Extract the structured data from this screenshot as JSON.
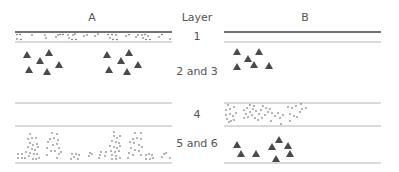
{
  "diagram": {
    "columns": {
      "left": "A",
      "middle": "Layer",
      "right": "B"
    },
    "layers": [
      {
        "id": "1",
        "label": "1"
      },
      {
        "id": "2-3",
        "label": "2 and 3"
      },
      {
        "id": "4",
        "label": "4"
      },
      {
        "id": "5-6",
        "label": "5 and 6"
      }
    ],
    "colors": {
      "dark_line": "#444444",
      "light_line": "#b5b5b5",
      "marker": "#4a4a4a",
      "text": "#555555"
    },
    "legend_glyphs": {
      "triangle": "triangle-marker",
      "dot": "dot-marker"
    },
    "panel_A": {
      "layer_1": "dots (dense band)",
      "layer_2_3": "two clusters of triangles",
      "layer_4": "empty",
      "layer_5_6": "dot clusters in columns"
    },
    "panel_B": {
      "layer_1": "empty",
      "layer_2_3": "one cluster of triangles",
      "layer_4": "dots (dense band)",
      "layer_5_6": "scattered triangles"
    }
  }
}
